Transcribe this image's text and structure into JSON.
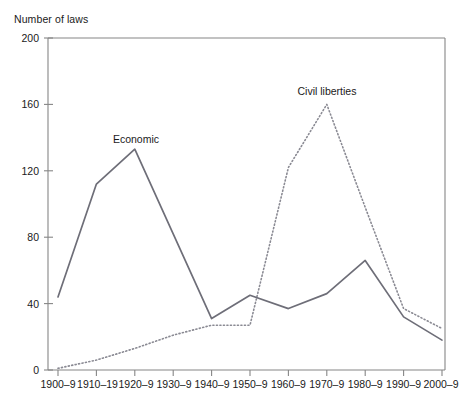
{
  "chart_data": {
    "type": "line",
    "title": "",
    "ylabel": "Number of laws",
    "xlabel": "",
    "categories": [
      "1900–9",
      "1910–19",
      "1920–9",
      "1930–9",
      "1940–9",
      "1950–9",
      "1960–9",
      "1970–9",
      "1980–9",
      "1990–9",
      "2000–9"
    ],
    "ylim": [
      0,
      200
    ],
    "yticks": [
      0,
      40,
      80,
      120,
      160,
      200
    ],
    "ytick_labels": [
      "0",
      "40",
      "80",
      "120",
      "160",
      "200"
    ],
    "grid": false,
    "legend_position": "inline-annotation",
    "series": [
      {
        "name": "Economic",
        "style": "solid",
        "color": "#6e6e78",
        "values": [
          44,
          112,
          133,
          82,
          31,
          45,
          37,
          46,
          66,
          32,
          18
        ],
        "annotation": {
          "label": "Economic",
          "x_category": "1920–9",
          "value": 133
        }
      },
      {
        "name": "Civil liberties",
        "style": "dotted",
        "color": "#8a8a93",
        "values": [
          1,
          6,
          13,
          21,
          27,
          27,
          122,
          160,
          98,
          37,
          25
        ],
        "annotation": {
          "label": "Civil liberties",
          "x_category": "1970–9",
          "value": 160
        }
      }
    ]
  },
  "caption": {
    "text": ""
  }
}
